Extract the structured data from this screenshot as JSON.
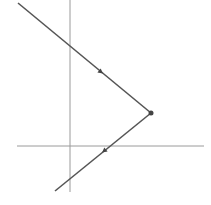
{
  "diagram": {
    "width": 211,
    "height": 205,
    "colors": {
      "background": "#ffffff",
      "axis": "#9a9a9a",
      "ray": "#555555",
      "vertex": "#444444"
    },
    "axes": {
      "vertical": {
        "x": 70,
        "y1": 0,
        "y2": 192
      },
      "horizontal": {
        "y": 146,
        "x1": 17,
        "x2": 204
      }
    },
    "rays": [
      {
        "name": "incoming-ray",
        "from": [
          18,
          3
        ],
        "to": [
          151,
          113
        ],
        "arrow_at": [
          101,
          72
        ],
        "direction": "toward-vertex"
      },
      {
        "name": "outgoing-ray",
        "from": [
          151,
          113
        ],
        "to": [
          55,
          191
        ],
        "arrow_at": [
          104,
          151
        ],
        "direction": "away-from-vertex"
      }
    ],
    "vertex": {
      "x": 151,
      "y": 113,
      "r": 2.5
    }
  }
}
